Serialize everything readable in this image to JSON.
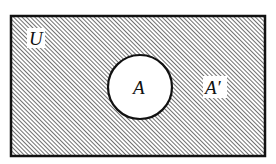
{
  "diagram": {
    "type": "venn",
    "title": "",
    "universe": {
      "label": "U",
      "shaded": true
    },
    "sets": [
      {
        "label": "A",
        "shaded": false
      }
    ],
    "complement": {
      "label": "A′",
      "shaded": true
    },
    "colors": {
      "background": "#ffffff",
      "stroke": "#111111",
      "hatch": "#222222"
    }
  }
}
